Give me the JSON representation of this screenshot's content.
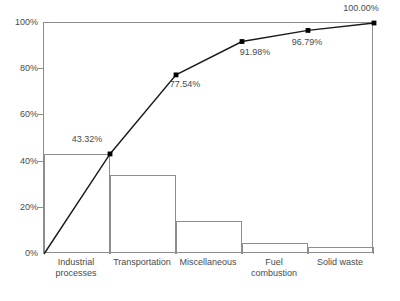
{
  "chart": {
    "title": "",
    "ylabel": "",
    "xlabel": ""
  },
  "chart_data": {
    "type": "bar",
    "title": "",
    "xlabel": "",
    "ylabel": "",
    "ylim": [
      0,
      100
    ],
    "grid": false,
    "legend": false,
    "categories": [
      "Industrial\nprocesses",
      "Transportation",
      "Miscellaneous",
      "Fuel\ncombustion",
      "Solid waste"
    ],
    "values": [
      43.32,
      34.22,
      14.44,
      4.81,
      3.21
    ],
    "series": [
      {
        "name": "Percent",
        "type": "bar",
        "values": [
          43.32,
          34.22,
          14.44,
          4.81,
          3.21
        ]
      },
      {
        "name": "Cumulative percent",
        "type": "line",
        "values": [
          43.32,
          77.54,
          91.98,
          96.79,
          100.0
        ],
        "labels": [
          "43.32%",
          "77.54%",
          "91.98%",
          "96.79%",
          "100.00%"
        ]
      }
    ],
    "y_ticks": [
      0,
      20,
      40,
      60,
      80,
      100
    ],
    "y_tick_labels": [
      "0%",
      "20%",
      "40%",
      "60%",
      "80%",
      "100%"
    ]
  },
  "axis": {
    "y_labels": [
      "100%",
      "80%",
      "60%",
      "40%",
      "20%",
      "0%"
    ],
    "y_values": [
      100,
      80,
      60,
      40,
      20,
      0
    ]
  },
  "categories": [
    {
      "label": "Industrial\nprocesses",
      "bar_value": 43.32,
      "cumulative": 43.32,
      "cumulative_label": "43.32%"
    },
    {
      "label": "Transportation",
      "bar_value": 34.22,
      "cumulative": 77.54,
      "cumulative_label": "77.54%"
    },
    {
      "label": "Miscellaneous",
      "bar_value": 14.44,
      "cumulative": 91.98,
      "cumulative_label": "91.98%"
    },
    {
      "label": "Fuel\ncombustion",
      "bar_value": 4.81,
      "cumulative": 96.79,
      "cumulative_label": "96.79%"
    },
    {
      "label": "Solid waste",
      "bar_value": 3.21,
      "cumulative": 100.0,
      "cumulative_label": "100.00%"
    }
  ],
  "colors": {
    "line": "#1a1a1a",
    "marker": "#000000",
    "bar_stroke": "#8d8d8d",
    "axis": "#8d8d8d",
    "text": "#4a4a4a"
  }
}
